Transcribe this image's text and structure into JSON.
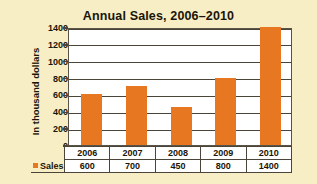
{
  "chart_data": {
    "type": "bar",
    "title": "Annual Sales, 2006–2010",
    "xlabel": "",
    "ylabel": "In thousand dollars",
    "categories": [
      "2006",
      "2007",
      "2008",
      "2009",
      "2010"
    ],
    "series": [
      {
        "name": "Sales",
        "values": [
          600,
          700,
          450,
          800,
          1400
        ],
        "color": "#e87722"
      }
    ],
    "values": [
      600,
      700,
      450,
      800,
      1400
    ],
    "ylim": [
      0,
      1400
    ],
    "ytick_step": 200,
    "yticks": [
      0,
      200,
      400,
      600,
      800,
      1000,
      1200,
      1400
    ],
    "ytick_labels": [
      "0",
      "200",
      "400",
      "600",
      "800",
      "1000",
      "1200",
      "1400"
    ],
    "grid": "horizontal",
    "legend_position": "bottom-table",
    "table": {
      "legend_label": "Sales",
      "header_row": [
        "2006",
        "2007",
        "2008",
        "2009",
        "2010"
      ],
      "value_row": [
        "600",
        "700",
        "450",
        "800",
        "1400"
      ]
    }
  },
  "colors": {
    "background": "#f7eec6",
    "plot_background": "#ffffff",
    "bar": "#e87722",
    "axis": "#4a4439",
    "text": "#1b1508"
  }
}
